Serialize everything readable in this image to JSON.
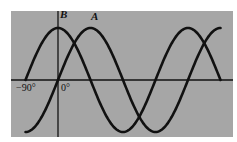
{
  "figure": {
    "background_color": "#a6a6a6",
    "page_color": "#ffffff",
    "line_color": "#111111",
    "curves": [
      {
        "name": "A",
        "function": "sin",
        "phase_deg": 0
      },
      {
        "name": "B",
        "function": "cos",
        "phase_deg": 90
      }
    ],
    "axis_labels": {
      "neg90": "−90°",
      "zero": "0°"
    },
    "curve_labels": {
      "A": "A",
      "B": "B"
    }
  },
  "chart_data": {
    "type": "line",
    "title": "",
    "xlabel": "phase angle",
    "ylabel": "",
    "x_tick_labels": [
      "−90°",
      "0°"
    ],
    "x_range_deg": [
      -90,
      450
    ],
    "series": [
      {
        "name": "A",
        "description": "sine wave, zero at 0°, peak at 90°",
        "x": [
          -90,
          0,
          90,
          180,
          270,
          360,
          450
        ],
        "values": [
          -1,
          0,
          1,
          0,
          -1,
          0,
          1
        ]
      },
      {
        "name": "B",
        "description": "cosine wave leading A by 90°, peak at 0°",
        "x": [
          -90,
          0,
          90,
          180,
          270,
          360,
          450
        ],
        "values": [
          0,
          1,
          0,
          -1,
          0,
          1,
          0
        ]
      }
    ],
    "grid": false,
    "legend": "inline labels above peaks"
  }
}
